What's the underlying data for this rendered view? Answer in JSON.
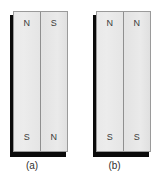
{
  "figure": {
    "type": "physics-diagram",
    "background_color": "#ffffff",
    "magnet_fill_color": "#e8e8e8",
    "magnet_border_color": "#9a9a9a",
    "shadow_color": "#0a0a0a",
    "label_color": "#3b3b3b",
    "panels": [
      {
        "id": "a",
        "caption": "(a)",
        "magnets": [
          {
            "position": "left",
            "top_pole": "N",
            "bottom_pole": "S"
          },
          {
            "position": "right",
            "top_pole": "S",
            "bottom_pole": "N"
          }
        ]
      },
      {
        "id": "b",
        "caption": "(b)",
        "magnets": [
          {
            "position": "left",
            "top_pole": "N",
            "bottom_pole": "S"
          },
          {
            "position": "right",
            "top_pole": "N",
            "bottom_pole": "S"
          }
        ]
      }
    ]
  }
}
